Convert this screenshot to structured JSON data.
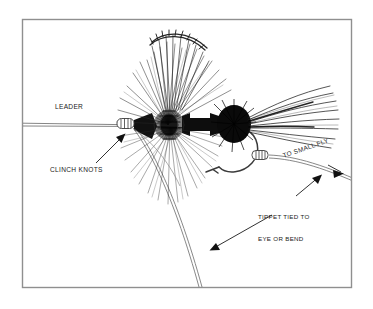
{
  "figure": {
    "frame": {
      "stroke_color": "#8a8a8a",
      "background": "#ffffff"
    },
    "ink_color": "#111111",
    "line_color": "#6b6b6b"
  },
  "labels": {
    "leader": "LEADER",
    "clinch_knots": "CLINCH KNOTS",
    "to_small_fly": "TO SMALL FLY",
    "tippet_line1": "TIPPET TIED TO",
    "tippet_line2": "EYE OR BEND"
  },
  "parts": {
    "leader_line": "leader-line",
    "tippet_line": "tippet-line",
    "dropper_line": "dropper-line",
    "front_knot": "clinch-knot-eye",
    "rear_knot": "clinch-knot-bend",
    "hook": "hook",
    "hackle_front": "front-hackle",
    "hackle_rear": "rear-hackle",
    "body": "fly-body",
    "wing": "wing",
    "tail": "tail"
  },
  "annotations": [
    {
      "name": "arrow-to-clinch-knots",
      "points_to": "clinch-knot-eye"
    },
    {
      "name": "arrow-to-small-fly",
      "points_to": "tippet-line"
    },
    {
      "name": "arrow-to-tippet-bend",
      "points_to": "tippet-line"
    },
    {
      "name": "arrow-to-dropper",
      "points_to": "dropper-line"
    }
  ]
}
